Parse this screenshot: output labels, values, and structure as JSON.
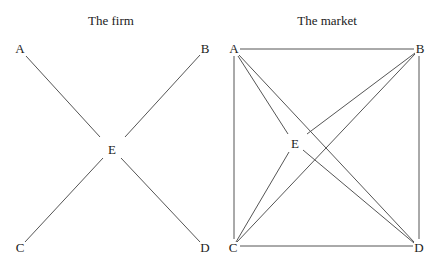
{
  "firm": {
    "title": "The firm",
    "nodes": {
      "A": "A",
      "B": "B",
      "C": "C",
      "D": "D",
      "E": "E"
    },
    "edges": [
      [
        "A",
        "E"
      ],
      [
        "B",
        "E"
      ],
      [
        "C",
        "E"
      ],
      [
        "D",
        "E"
      ]
    ]
  },
  "market": {
    "title": "The market",
    "nodes": {
      "A": "A",
      "B": "B",
      "C": "C",
      "D": "D",
      "E": "E"
    },
    "edges": [
      [
        "A",
        "B"
      ],
      [
        "A",
        "C"
      ],
      [
        "B",
        "D"
      ],
      [
        "C",
        "D"
      ],
      [
        "A",
        "D"
      ],
      [
        "B",
        "C"
      ],
      [
        "A",
        "E"
      ],
      [
        "B",
        "E"
      ],
      [
        "C",
        "E"
      ],
      [
        "D",
        "E"
      ]
    ]
  },
  "colors": {
    "line": "#555555",
    "text": "#222222",
    "background": "#ffffff"
  }
}
